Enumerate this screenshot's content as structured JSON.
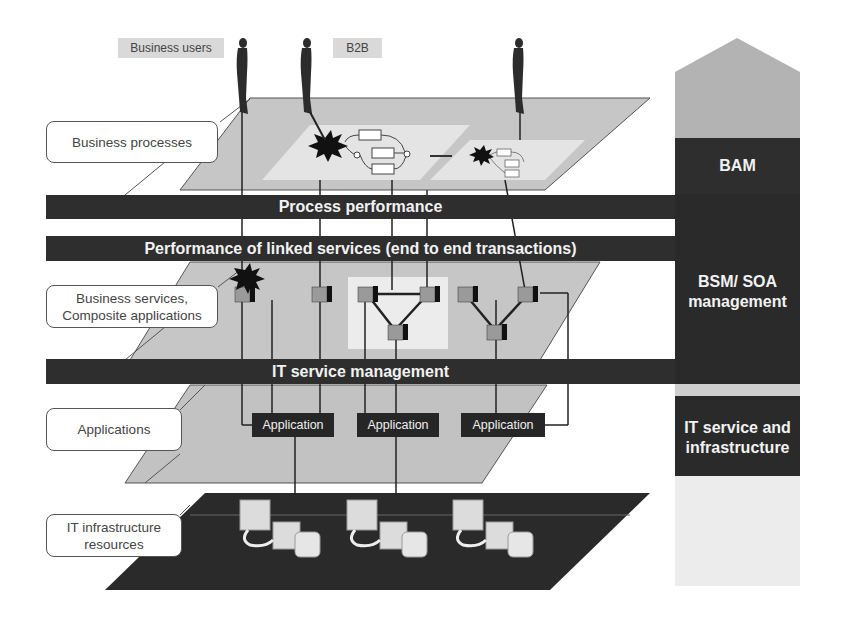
{
  "actors": {
    "business_users_label": "Business users",
    "b2b_label": "B2B",
    "count": 3
  },
  "layers": {
    "business_processes": "Business processes",
    "business_services_line1": "Business services,",
    "business_services_line2": "Composite applications",
    "applications": "Applications",
    "it_infra_line1": "IT infrastructure",
    "it_infra_line2": "resources"
  },
  "bars": {
    "process_performance": "Process performance",
    "linked_services": "Performance of linked services (end to end transactions)",
    "it_service_management": "IT service management"
  },
  "applications": [
    "Application",
    "Application",
    "Application"
  ],
  "side_column": {
    "bam": "BAM",
    "bsm_line1": "BSM/ SOA",
    "bsm_line2": "management",
    "it_line1": "IT service and",
    "it_line2": "infrastructure"
  },
  "colors": {
    "bar_dark": "#2e2e2e",
    "plane_gray": "#c4c4c4",
    "plane_light": "#e6e6e6",
    "arrow_gray": "#b3b3b3",
    "infra_plane": "#2a2a2a"
  }
}
